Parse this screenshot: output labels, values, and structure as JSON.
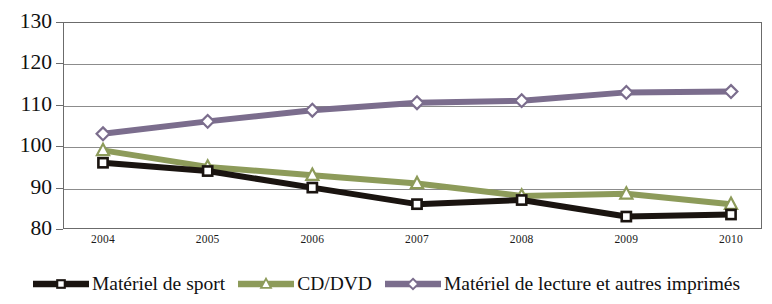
{
  "chart_data": {
    "type": "line",
    "title": "",
    "subtitle": "",
    "xlabel": "",
    "ylabel": "",
    "categories": [
      "2004",
      "2005",
      "2006",
      "2007",
      "2008",
      "2009",
      "2010"
    ],
    "ylim": [
      80,
      130
    ],
    "ytick_labels": [
      "80",
      "90",
      "100",
      "110",
      "120",
      "130"
    ],
    "ytick_values": [
      80,
      90,
      100,
      110,
      120,
      130
    ],
    "grid": true,
    "legend_position": "bottom",
    "series": [
      {
        "name": "Matériel de sport",
        "color": "#1a1410",
        "marker": "square",
        "marker_fill": "#ffffff",
        "values": [
          96,
          94,
          90,
          86,
          87,
          83,
          83.5
        ]
      },
      {
        "name": "CD/DVD",
        "color": "#8d9b5a",
        "marker": "triangle",
        "marker_fill": "#ffffff",
        "values": [
          99,
          95,
          93,
          91,
          88,
          88.5,
          86
        ]
      },
      {
        "name": "Matériel de lecture et autres imprimés",
        "color": "#7b6d8d",
        "marker": "diamond",
        "marker_fill": "#ffffff",
        "values": [
          103,
          106,
          108.7,
          110.5,
          111,
          113,
          113.2
        ]
      }
    ]
  },
  "axis": {
    "frame_color": "#6b6b6b",
    "gridline_color": "#8c8c8c",
    "text_color": "#111111"
  }
}
